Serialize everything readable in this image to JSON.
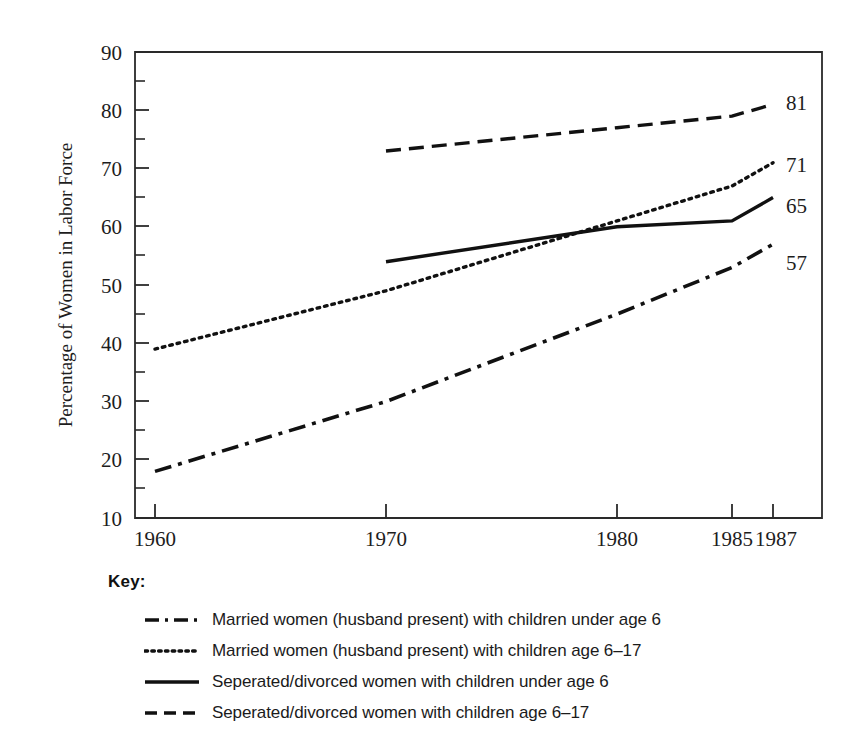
{
  "chart_data": {
    "type": "line",
    "title": "",
    "xlabel": "",
    "ylabel": "Percentage of Women in Labor Force",
    "x": [
      1960,
      1970,
      1980,
      1985,
      1987
    ],
    "xtick_labels": [
      "1960",
      "1970",
      "1980",
      "1985",
      "1987"
    ],
    "ytick_labels": [
      "10",
      "20",
      "30",
      "40",
      "50",
      "60",
      "70",
      "80",
      "90"
    ],
    "ylim": [
      10,
      90
    ],
    "ytick_step": 10,
    "yminor_step": 5,
    "grid": false,
    "legend_position": "below-plot",
    "legend_title": "Key:",
    "series": [
      {
        "name": "Married women (husband present) with children under age 6",
        "style": "dash-dot",
        "x": [
          1960,
          1970,
          1980,
          1985,
          1987
        ],
        "values": [
          18,
          30,
          45,
          53,
          57
        ],
        "end_label": "57"
      },
      {
        "name": "Married women (husband present) with children age 6–17",
        "style": "dotted",
        "x": [
          1960,
          1970,
          1980,
          1985,
          1987
        ],
        "values": [
          39,
          49,
          61,
          67,
          71
        ],
        "end_label": "71"
      },
      {
        "name": "Seperated/divorced women with children under age 6",
        "style": "solid",
        "x": [
          1970,
          1980,
          1985,
          1987
        ],
        "values": [
          54,
          60,
          61,
          65
        ],
        "end_label": "65"
      },
      {
        "name": "Seperated/divorced women with children age 6–17",
        "style": "dashed",
        "x": [
          1970,
          1980,
          1985,
          1987
        ],
        "values": [
          73,
          77,
          79,
          81
        ],
        "end_label": "81"
      }
    ]
  },
  "axis": {
    "y_title": "Percentage of Women in Labor Force",
    "y_ticks": [
      "90",
      "80",
      "70",
      "60",
      "50",
      "40",
      "30",
      "20",
      "10"
    ],
    "x_ticks": [
      "1960",
      "1970",
      "1980",
      "1985",
      "1987"
    ]
  },
  "end_labels": {
    "dashed_81": "81",
    "dotted_71": "71",
    "solid_65": "65",
    "dashdot_57": "57"
  },
  "legend": {
    "title": "Key:",
    "items": [
      {
        "style": "dash-dot",
        "label": "Married women (husband present) with children under age 6"
      },
      {
        "style": "dotted",
        "label": "Married women (husband present) with children age 6–17"
      },
      {
        "style": "solid",
        "label": "Seperated/divorced women with children under age 6"
      },
      {
        "style": "dashed",
        "label": "Seperated/divorced women with children age 6–17"
      }
    ]
  },
  "colors": {
    "ink": "#111111",
    "axis": "#2a2a2a",
    "background": "#ffffff"
  }
}
